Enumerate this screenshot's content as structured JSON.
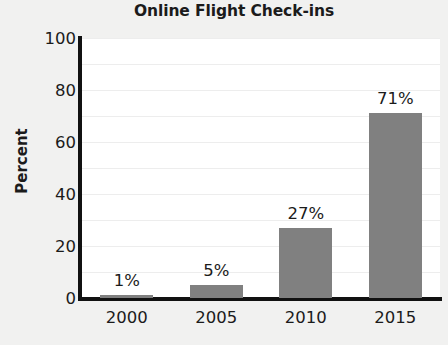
{
  "chart_data": {
    "type": "bar",
    "title": "Online Flight Check-ins",
    "xlabel": "",
    "ylabel": "Percent",
    "categories": [
      "2000",
      "2005",
      "2010",
      "2015"
    ],
    "values": [
      1,
      5,
      27,
      71
    ],
    "value_labels": [
      "1%",
      "5%",
      "27%",
      "71%"
    ],
    "ylim": [
      0,
      100
    ],
    "yticks": [
      100,
      80,
      60,
      40,
      20,
      0
    ],
    "ytick_labels": [
      "100",
      "80",
      "60",
      "40",
      "20",
      "0"
    ],
    "gridlines": true,
    "gridline_step": 10,
    "legend": null,
    "colors": {
      "bar": "#808080",
      "plot_background": "#ffffff",
      "figure_background": "#f1f1f0",
      "axis": "#111111",
      "gridline": "#ededed",
      "text": "#1b1b1b"
    }
  }
}
